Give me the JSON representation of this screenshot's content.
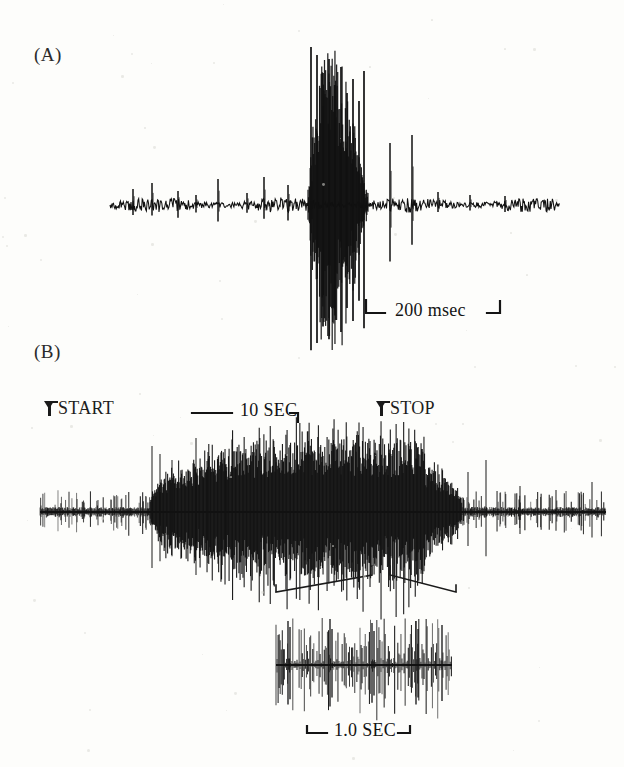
{
  "figure": {
    "background_color": "#fdfdfb",
    "ink_color": "#111111",
    "width": 624,
    "height": 767
  },
  "panels": [
    {
      "id": "A",
      "label": "(A)",
      "label_x": 34,
      "label_y": 44,
      "description": "single-unit extracellular recording with burst"
    },
    {
      "id": "B",
      "label": "(B)",
      "label_x": 34,
      "label_y": 341,
      "description": "compressed time-base recording with expanded inset"
    }
  ],
  "markers": [
    {
      "name": "start",
      "text": "START",
      "x": 48,
      "y": 398,
      "arrow_x": 44,
      "arrow_y": 408
    },
    {
      "name": "stop",
      "text": "STOP",
      "x": 380,
      "y": 398,
      "arrow_x": 376,
      "arrow_y": 408
    }
  ],
  "scale_bars": [
    {
      "name": "panel-a-scale",
      "text": "200 msec",
      "value": 200,
      "unit": "msec",
      "label_x": 395,
      "label_y": 300,
      "bar_x1": 366,
      "bar_x2": 500,
      "bar_y": 313,
      "cap_style": "bracket-both"
    },
    {
      "name": "panel-b-scale",
      "text": "10 SEC",
      "value": 10,
      "unit": "SEC",
      "label_x": 240,
      "label_y": 400,
      "bar_x1": 192,
      "bar_x2": 298,
      "bar_y": 413,
      "cap_style": "hook-right"
    },
    {
      "name": "inset-scale",
      "text": "1.0 SEC",
      "value": 1.0,
      "unit": "SEC",
      "label_x": 334,
      "label_y": 720,
      "bar_x1": 307,
      "bar_x2": 410,
      "bar_y": 733,
      "cap_style": "bracket-both"
    }
  ],
  "chart_data": {
    "type": "line",
    "title": "",
    "xlabel": "",
    "ylabel": "",
    "panels": [
      {
        "name": "panel-a-trace",
        "baseline_y": 205,
        "x_start": 110,
        "x_end": 560,
        "noise_amplitude": 5,
        "time_scale": "200 msec bar",
        "events": [
          {
            "type": "spike",
            "x": 133,
            "amp": 16
          },
          {
            "type": "spike",
            "x": 152,
            "amp": 22
          },
          {
            "type": "spike",
            "x": 178,
            "amp": 14
          },
          {
            "type": "spike",
            "x": 196,
            "amp": 10
          },
          {
            "type": "spike",
            "x": 218,
            "amp": 26
          },
          {
            "type": "spike",
            "x": 247,
            "amp": 12
          },
          {
            "type": "spike",
            "x": 264,
            "amp": 28
          },
          {
            "type": "spike",
            "x": 288,
            "amp": 20
          },
          {
            "type": "burst",
            "x_start": 308,
            "x_end": 368,
            "max_amp": 160
          },
          {
            "type": "spike",
            "x": 390,
            "amp": 62
          },
          {
            "type": "spike",
            "x": 412,
            "amp": 70
          },
          {
            "type": "spike",
            "x": 438,
            "amp": 13
          },
          {
            "type": "spike",
            "x": 470,
            "amp": 10
          },
          {
            "type": "spike",
            "x": 505,
            "amp": 9
          }
        ]
      },
      {
        "name": "panel-b-trace",
        "baseline_y": 512,
        "x_start": 40,
        "x_end": 606,
        "noise_amplitude": 4,
        "time_scale": "10 SEC bar",
        "burst_region": {
          "x_start": 150,
          "x_end": 462
        },
        "peak_region": {
          "x_start": 352,
          "x_end": 425
        }
      },
      {
        "name": "inset-trace",
        "baseline_y": 665,
        "x_start": 276,
        "x_end": 452,
        "noise_amplitude": 3,
        "time_scale": "1.0 SEC bar",
        "description": "time-expanded segment of panel B burst"
      }
    ],
    "expansion_brackets": {
      "apex_left_x": 372,
      "apex_right_x": 390,
      "apex_y": 572,
      "left_end_x": 276,
      "right_end_x": 456,
      "end_y": 592
    }
  }
}
